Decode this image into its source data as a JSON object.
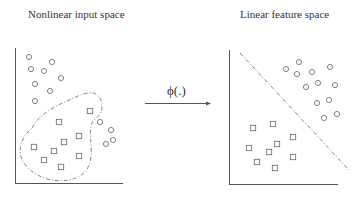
{
  "left_panel": {
    "title": "Nonlinear input space",
    "circles": [
      [
        29,
        57
      ],
      [
        52,
        62
      ],
      [
        31,
        69
      ],
      [
        44,
        71
      ],
      [
        61,
        78
      ],
      [
        35,
        84
      ],
      [
        50,
        91
      ],
      [
        35,
        101
      ],
      [
        100,
        122
      ],
      [
        111,
        130
      ],
      [
        113,
        140
      ],
      [
        106,
        144
      ]
    ],
    "squares": [
      [
        90,
        111
      ],
      [
        59,
        122
      ],
      [
        79,
        136
      ],
      [
        64,
        142
      ],
      [
        34,
        147
      ],
      [
        54,
        151
      ],
      [
        79,
        156
      ],
      [
        44,
        160
      ],
      [
        61,
        167
      ]
    ],
    "boundary": "nonlinear dash-dot closed curve enclosing squares"
  },
  "mapping": {
    "label": "ϕ(.)",
    "arrow": "right-arrow"
  },
  "right_panel": {
    "title": "Linear feature space",
    "circles": [
      [
        286,
        69
      ],
      [
        299,
        62
      ],
      [
        297,
        74
      ],
      [
        312,
        72
      ],
      [
        330,
        67
      ],
      [
        318,
        83
      ],
      [
        306,
        87
      ],
      [
        335,
        85
      ],
      [
        329,
        100
      ],
      [
        317,
        103
      ],
      [
        337,
        114
      ],
      [
        324,
        118
      ]
    ],
    "squares": [
      [
        253,
        128
      ],
      [
        273,
        124
      ],
      [
        293,
        137
      ],
      [
        277,
        144
      ],
      [
        249,
        148
      ],
      [
        269,
        152
      ],
      [
        293,
        157
      ],
      [
        257,
        162
      ],
      [
        275,
        168
      ]
    ],
    "boundary": "linear dash-dot separating line"
  },
  "colors": {
    "stroke": "#666666",
    "axis": "#555555",
    "text": "#333333"
  }
}
